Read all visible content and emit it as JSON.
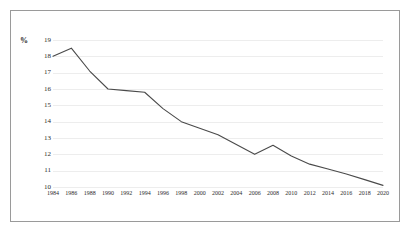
{
  "figure": {
    "axis_unit_label": "%",
    "border_color": "#9a9a9a",
    "background_color": "#ffffff",
    "line_color": "#4a4a4a",
    "gridline_color": "#ededed",
    "tick_text_color": "#2b2b2b"
  },
  "chart_data": {
    "type": "line",
    "title": "",
    "subtitle": "",
    "xlabel": "",
    "ylabel": "%",
    "legend": [],
    "legend_position": "none",
    "grid": true,
    "grid_axis": "y",
    "xlim": [
      1984,
      2020
    ],
    "ylim": [
      10,
      19
    ],
    "ytick_labels": [
      "19",
      "18",
      "17",
      "16",
      "15",
      "14",
      "13",
      "12",
      "11",
      "10"
    ],
    "yticks": [
      19,
      18,
      17,
      16,
      15,
      14,
      13,
      12,
      11,
      10
    ],
    "xtick_labels": [
      "1984",
      "1986",
      "1988",
      "1990",
      "1992",
      "1994",
      "1996",
      "1998",
      "2000",
      "2002",
      "2004",
      "2006",
      "2008",
      "2010",
      "2012",
      "2014",
      "2016",
      "2018",
      "2020"
    ],
    "x": [
      1984,
      1986,
      1988,
      1990,
      1992,
      1994,
      1996,
      1998,
      2000,
      2002,
      2004,
      2006,
      2008,
      2010,
      2012,
      2014,
      2016,
      2018,
      2020
    ],
    "series": [
      {
        "name": "",
        "values": [
          18.0,
          18.5,
          17.1,
          16.0,
          15.9,
          15.8,
          14.8,
          14.0,
          13.6,
          13.2,
          12.6,
          12.0,
          12.55,
          11.9,
          11.4,
          11.1,
          10.8,
          10.45,
          10.1
        ]
      }
    ]
  }
}
